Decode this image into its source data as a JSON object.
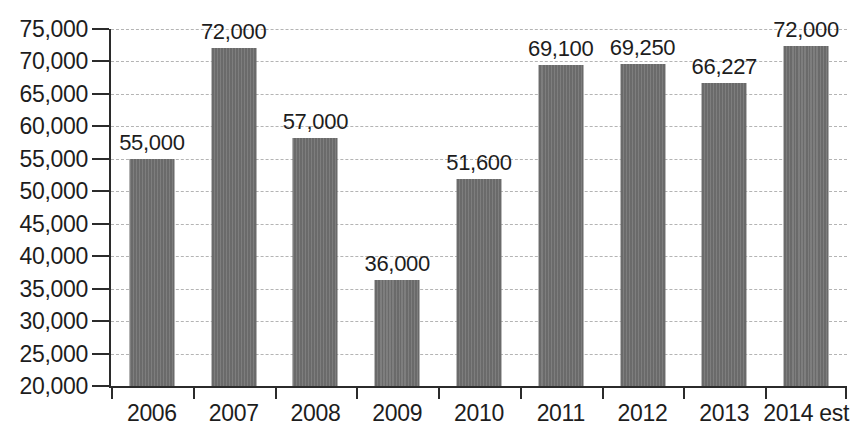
{
  "chart_data": {
    "type": "bar",
    "title": "",
    "subtitle": "",
    "xlabel": "",
    "ylabel": "",
    "categories": [
      "2006",
      "2007",
      "2008",
      "2009",
      "2010",
      "2011",
      "2012",
      "2013",
      "2014 est"
    ],
    "values": [
      55000,
      72000,
      57000,
      36000,
      51600,
      69100,
      69250,
      66227,
      72000
    ],
    "plotted_values": [
      55000,
      72100,
      58200,
      36300,
      51900,
      69400,
      69550,
      66700,
      72400
    ],
    "data_labels": [
      "55,000",
      "72,000",
      "57,000",
      "36,000",
      "51,600",
      "69,100",
      "69,250",
      "66,227",
      "72,000"
    ],
    "ylim": [
      20000,
      75000
    ],
    "y_tick_step": 5000,
    "y_tick_labels": [
      "75,000",
      "70,000",
      "65,000",
      "60,000",
      "55,000",
      "50,000",
      "45,000",
      "40,000",
      "35,000",
      "30,000",
      "25,000",
      "20,000"
    ],
    "y_tick_values": [
      75000,
      70000,
      65000,
      60000,
      55000,
      50000,
      45000,
      40000,
      35000,
      30000,
      25000,
      20000
    ],
    "grid": true,
    "grid_axis": "y",
    "legend": false,
    "legend_position": "none",
    "bar_color": "#6f6f6f",
    "axis_color": "#2b2b2b",
    "grid_color": "#b4b4b4",
    "text_color": "#1d1d1d",
    "background_color": "#ffffff"
  }
}
